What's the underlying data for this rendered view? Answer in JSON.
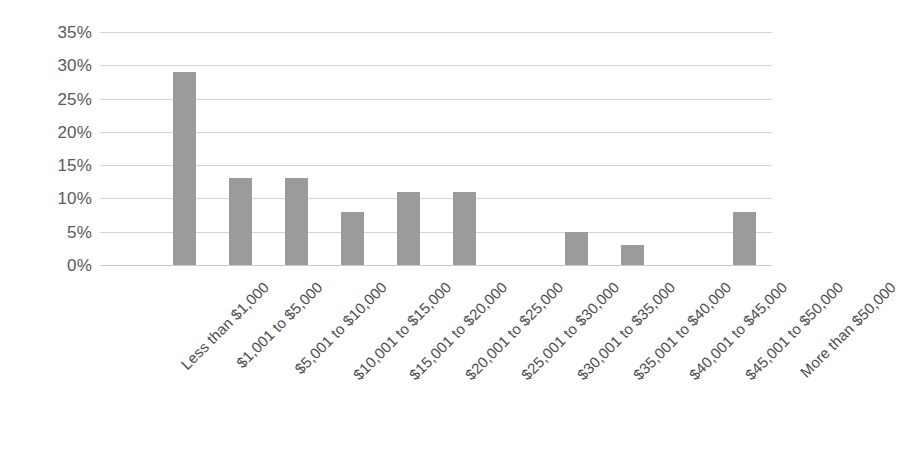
{
  "chart_data": {
    "type": "bar",
    "title": "",
    "subtitle": "",
    "xlabel": "",
    "ylabel": "",
    "ylim": [
      0,
      35
    ],
    "yticks": [
      "0%",
      "5%",
      "10%",
      "15%",
      "20%",
      "25%",
      "30%",
      "35%"
    ],
    "ytick_values": [
      0,
      5,
      10,
      15,
      20,
      25,
      30,
      35
    ],
    "grid": true,
    "legend": false,
    "value_unit": "%",
    "bar_color": "#9b9b9b",
    "gridline_color": "#d4d4d4",
    "label_color": "#4d4d4d",
    "categories": [
      "Less than $1,000",
      "$1,001 to $5,000",
      "$5,001 to $10,000",
      "$10,001 to $15,000",
      "$15,001 to $20,000",
      "$20,001 to $25,000",
      "$25,001 to $30,000",
      "$30,001 to $35,000",
      "$35,001 to $40,000",
      "$40,001 to $45,000",
      "$45,001 to $50,000",
      "More than $50,000"
    ],
    "values": [
      0,
      29,
      13,
      13,
      8,
      11,
      11,
      0,
      5,
      3,
      0,
      8
    ]
  }
}
